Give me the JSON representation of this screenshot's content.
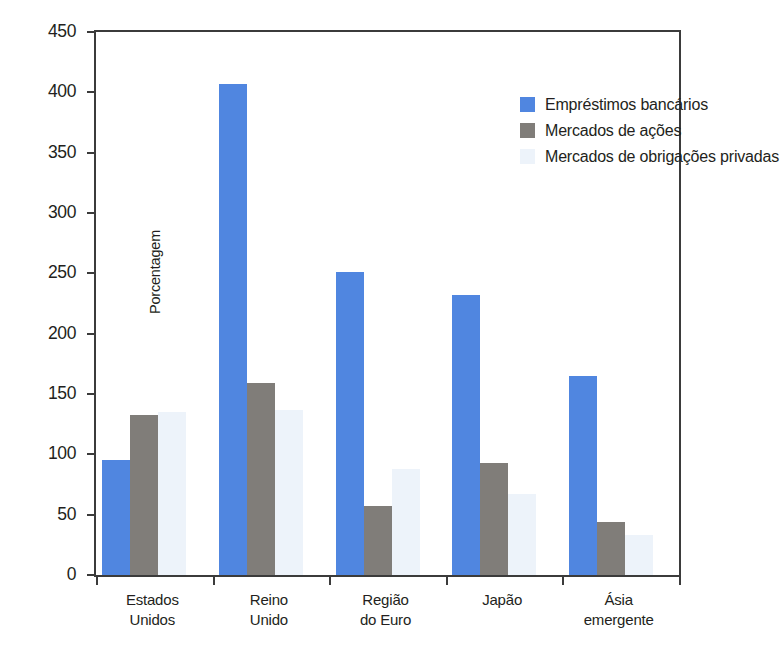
{
  "chart_data": {
    "type": "bar",
    "title": "",
    "subtitle": "",
    "xlabel": "",
    "ylabel": "Porcentagem",
    "ylim": [
      0,
      450
    ],
    "ytick_step": 50,
    "yticks": [
      450,
      400,
      350,
      300,
      250,
      200,
      150,
      100,
      50,
      0
    ],
    "grid": false,
    "legend_position": "top-right",
    "categories": [
      "Estados Unidos",
      "Reino Unido",
      "Região do Euro",
      "Japão",
      "Ásia emergente"
    ],
    "category_lines": [
      [
        "Estados",
        "Unidos"
      ],
      [
        "Reino",
        "Unido"
      ],
      [
        "Região",
        "do Euro"
      ],
      [
        "Japão",
        ""
      ],
      [
        "Ásia",
        "emergente"
      ]
    ],
    "series": [
      {
        "name": "Empréstimos bancários",
        "color": "#5086e0",
        "values": [
          95,
          407,
          251,
          232,
          165
        ]
      },
      {
        "name": "Mercados de ações",
        "color": "#807d79",
        "values": [
          133,
          159,
          57,
          93,
          44
        ]
      },
      {
        "name": "Mercados de obrigações privadas",
        "color": "#edf3fa",
        "values": [
          135,
          137,
          88,
          67,
          33
        ]
      }
    ]
  },
  "axis": {
    "y_title": "Porcentagem",
    "y_tick_labels": [
      "450",
      "400",
      "350",
      "300",
      "250",
      "200",
      "150",
      "100",
      "50",
      "0"
    ]
  },
  "legend": {
    "items": [
      {
        "label": "Empréstimos bancários",
        "swatch": "loans"
      },
      {
        "label": "Mercados de ações",
        "swatch": "equity"
      },
      {
        "label": "Mercados de obrigações privadas",
        "swatch": "bonds"
      }
    ]
  },
  "colors": {
    "bank_loans": "#5086e0",
    "equity_markets": "#807d79",
    "private_bond_markets": "#edf3fa",
    "axis": "#3b3b3b",
    "text": "#231f20",
    "background": "#ffffff"
  }
}
